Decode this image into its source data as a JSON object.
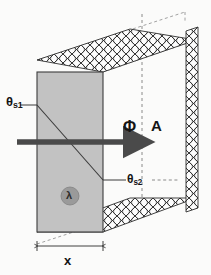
{
  "figure": {
    "labels": {
      "surface_temp_1": "θ",
      "surface_temp_1_sub": "s1",
      "surface_temp_2": "θ",
      "surface_temp_2_sub": "s2",
      "heat_flow": "Φ",
      "area": "A",
      "conductivity": "λ",
      "thickness": "x"
    },
    "colors": {
      "slab_fill": "#c2c2c2",
      "slab_stroke": "#3d3d3d",
      "lambda_circle": "#9a9a9a",
      "arrow": "#4a4a4a",
      "hatch_stroke": "#2e2e2e",
      "hatch_fill": "#fdfdfd",
      "dashed_stroke": "#707070",
      "background": "#fbfbfa",
      "text": "#141414"
    },
    "elements": {
      "slab": "grey conducting wall slab seen edge-on",
      "insulation": "cross-hatched insulation bands on top, bottom and right face",
      "gradient_line": "diagonal line across slab showing linear temperature drop",
      "flow_arrow": "thick horizontal arrow pointing right",
      "area_plane": "vertical dashed line marking cross-section plane",
      "dimension": "double headed dimension line under the slab"
    }
  }
}
